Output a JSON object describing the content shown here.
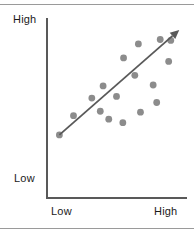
{
  "figure": {
    "title": "",
    "width": 194,
    "height": 232,
    "background": "#ffffff",
    "rule_color": "#9a9a9a"
  },
  "chart_data": {
    "type": "scatter",
    "title": "",
    "xlabel": "",
    "ylabel": "",
    "xlim": [
      0,
      10
    ],
    "ylim": [
      0,
      10
    ],
    "grid": false,
    "legend": null,
    "xtick_labels": [
      "Low",
      "High"
    ],
    "ytick_labels": [
      "Low",
      "High"
    ],
    "point_color": "#8c8c8c",
    "point_radius": 3.4,
    "axis_color": "#595959",
    "relationship": "positive correlation",
    "points": [
      {
        "x": 0.95,
        "y": 3.55
      },
      {
        "x": 1.95,
        "y": 4.65
      },
      {
        "x": 3.25,
        "y": 5.65
      },
      {
        "x": 4.05,
        "y": 6.35
      },
      {
        "x": 3.85,
        "y": 4.9
      },
      {
        "x": 4.45,
        "y": 4.45
      },
      {
        "x": 5.0,
        "y": 5.75
      },
      {
        "x": 5.5,
        "y": 7.95
      },
      {
        "x": 5.45,
        "y": 4.25
      },
      {
        "x": 6.3,
        "y": 6.95
      },
      {
        "x": 6.55,
        "y": 8.75
      },
      {
        "x": 6.7,
        "y": 4.85
      },
      {
        "x": 7.6,
        "y": 6.4
      },
      {
        "x": 7.85,
        "y": 5.4
      },
      {
        "x": 8.1,
        "y": 9.0
      },
      {
        "x": 8.7,
        "y": 7.75
      },
      {
        "x": 8.85,
        "y": 8.95
      }
    ],
    "trend_line": {
      "start": {
        "x": 0.95,
        "y": 3.55
      },
      "end": {
        "x": 9.45,
        "y": 9.55
      },
      "arrow": true,
      "color": "#595959"
    }
  },
  "labels": {
    "y_axis_high": "High",
    "y_axis_low": "Low",
    "x_axis_low": "Low",
    "x_axis_high": "High"
  }
}
